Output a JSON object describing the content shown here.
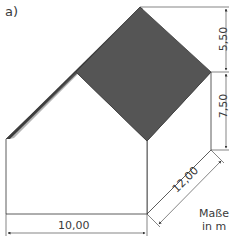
{
  "figure": {
    "part_label": "a)",
    "dimensions": {
      "width": "10,00",
      "depth": "12,00",
      "roof_height": "5,50",
      "wall_height": "7,50"
    },
    "units_label": "Maße in m"
  },
  "colors": {
    "roof": "#555555",
    "roof_edge": "#3c3c3c",
    "walls": "#ffffff",
    "lines": "#333333"
  }
}
